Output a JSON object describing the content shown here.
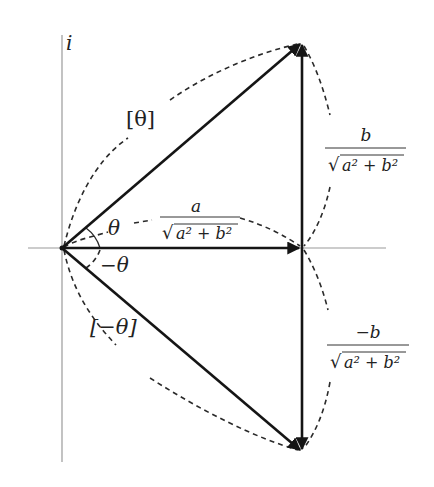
{
  "diagram": {
    "axis": {
      "imag_label": "i"
    },
    "labels": {
      "theta_vector": "[θ]",
      "neg_theta_vector": "[−θ]",
      "theta_angle": "θ",
      "neg_theta_angle": "−θ"
    },
    "fractions": {
      "real_part": {
        "numerator": "a",
        "denominator_root": "√",
        "denominator": "a² + b²"
      },
      "imag_part_pos": {
        "numerator": "b",
        "denominator_root": "√",
        "denominator": "a² + b²"
      },
      "imag_part_neg": {
        "numerator": "−b",
        "denominator_root": "√",
        "denominator": "a² + b²"
      }
    },
    "points": {
      "origin": [
        62,
        248
      ],
      "top": [
        302,
        42
      ],
      "middle": [
        302,
        248
      ],
      "bottom": [
        302,
        452
      ]
    },
    "colors": {
      "vector": "#151515",
      "axis": "#9a9a9a",
      "dash": "#2a2a2a"
    }
  }
}
